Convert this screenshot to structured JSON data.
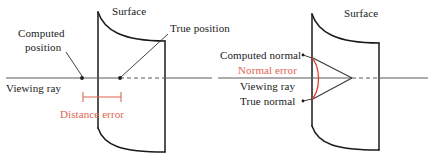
{
  "figure": {
    "width": 432,
    "height": 161,
    "background": "#ffffff"
  },
  "colors": {
    "ink": "#1a1a1a",
    "ray": "#5a5a5a",
    "error_red": "#e0654f",
    "arc_red": "#e0402a"
  },
  "left_panel": {
    "name": "distance-error-diagram",
    "labels": {
      "surface": "Surface",
      "computed_position_line1": "Computed",
      "computed_position_line2": "position",
      "true_position": "True position",
      "viewing_ray": "Viewing ray",
      "distance_error": "Distance error"
    }
  },
  "right_panel": {
    "name": "normal-error-diagram",
    "labels": {
      "surface": "Surface",
      "computed_normal": "Computed normal",
      "normal_error": "Normal error",
      "viewing_ray": "Viewing ray",
      "true_normal": "True normal"
    }
  }
}
